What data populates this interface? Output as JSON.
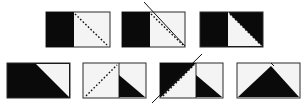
{
  "diagram": {
    "colors": {
      "fill_dark": "#0a0a0a",
      "fill_light": "#f4f4f4",
      "border": "#2a2a2a",
      "line": "#111111"
    },
    "rows": [
      {
        "panels": [
          {
            "id": "top-1",
            "x": 46,
            "y": 12,
            "w": 64,
            "h": 35,
            "desc": "left half black, right half white with dashed diagonal"
          },
          {
            "id": "top-2",
            "x": 122,
            "y": 12,
            "w": 63,
            "h": 35,
            "desc": "same as top-1 with solid cut line across diagonal"
          },
          {
            "id": "top-3",
            "x": 200,
            "y": 12,
            "w": 63,
            "h": 35,
            "desc": "left half black, right half has black upper-right triangle, dashed diagonal"
          }
        ]
      },
      {
        "panels": [
          {
            "id": "bottom-1",
            "x": 7,
            "y": 63,
            "w": 63,
            "h": 35,
            "desc": "black with white upper-right triangle"
          },
          {
            "id": "bottom-2",
            "x": 83,
            "y": 63,
            "w": 63,
            "h": 35,
            "desc": "white left half with dashed diagonal, right half black lower-left triangle"
          },
          {
            "id": "bottom-3",
            "x": 160,
            "y": 63,
            "w": 63,
            "h": 35,
            "desc": "left half black upper triangle with solid cut line, right half black lower-left triangle"
          },
          {
            "id": "bottom-4",
            "x": 237,
            "y": 63,
            "w": 63,
            "h": 35,
            "desc": "white with black central peak triangle"
          }
        ]
      }
    ]
  }
}
